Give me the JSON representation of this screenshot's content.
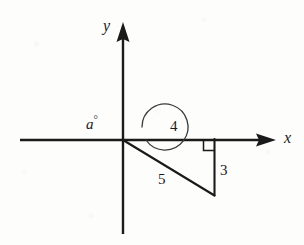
{
  "figure": {
    "kind": "math-diagram",
    "width": 304,
    "height": 245,
    "background_color": "#fdfdfc",
    "ink_color": "#1a1a1a"
  },
  "axes": {
    "x_label": "x",
    "y_label": "y",
    "origin": {
      "x": 123,
      "y": 140
    },
    "x_axis": {
      "start_x": 20,
      "end_x": 276,
      "y": 140
    },
    "y_axis": {
      "x": 123,
      "top_y": 22,
      "bottom_y": 234
    },
    "arrow_style": "solid-filled-triangle"
  },
  "angle": {
    "label": "a",
    "degree_symbol": "°",
    "full_label": "a°",
    "arc_type": "near-full-circle",
    "arc_center": {
      "x": 123,
      "y": 140
    },
    "arc_radius": 23,
    "measured_from": "positive x-axis",
    "direction": "counterclockwise"
  },
  "triangle": {
    "vertices": {
      "origin": {
        "x": 123,
        "y": 140
      },
      "right_angle_corner": {
        "x": 214,
        "y": 140
      },
      "bottom": {
        "x": 214,
        "y": 195
      }
    },
    "sides": [
      {
        "name": "adjacent",
        "label": "4",
        "label_x": 170,
        "label_y": 120,
        "orientation": "horizontal"
      },
      {
        "name": "opposite",
        "label": "3",
        "label_x": 219,
        "label_y": 164,
        "orientation": "vertical"
      },
      {
        "name": "hypotenuse",
        "label": "5",
        "label_x": 158,
        "label_y": 172,
        "orientation": "diagonal"
      }
    ],
    "right_angle_marker": {
      "present": true,
      "x": 203,
      "y": 140,
      "size": 10,
      "at_vertex": "right_angle_corner"
    }
  },
  "labels": {
    "y_axis": "y",
    "x_axis": "x",
    "angle": "a",
    "degree": "°",
    "side_adjacent": "4",
    "side_opposite": "3",
    "side_hypotenuse": "5"
  }
}
